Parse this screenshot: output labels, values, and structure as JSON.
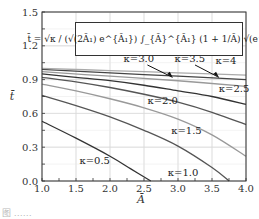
{
  "chart_data": {
    "type": "line",
    "title": "",
    "xlabel": "Ā",
    "ylabel": "t̄",
    "xlim": [
      1.0,
      4.0
    ],
    "ylim": [
      0.0,
      1.5
    ],
    "xticks": [
      "1.0",
      "1.5",
      "2.0",
      "2.5",
      "3.0",
      "3.5",
      "4.0"
    ],
    "yticks": [
      "0.0",
      "0.3",
      "0.6",
      "0.9",
      "1.2",
      "1.5"
    ],
    "grid": true,
    "formula": "t̄ = √κ / (√(2Ā₁) e^{Ā₁}) ∫_{Ā}^{Ā₁} (1 + 1/Ā) √(e^Ā) dĀ",
    "series": [
      {
        "name": "κ=0.5",
        "label": "κ=0.5",
        "x": [
          1.0,
          1.5,
          2.0,
          2.3,
          2.6
        ],
        "y": [
          0.53,
          0.38,
          0.22,
          0.11,
          0.0
        ]
      },
      {
        "name": "κ=1.0",
        "label": "κ=1.0",
        "x": [
          1.0,
          1.5,
          2.0,
          2.5,
          3.0,
          3.5,
          3.75
        ],
        "y": [
          0.76,
          0.67,
          0.57,
          0.45,
          0.31,
          0.12,
          0.0
        ]
      },
      {
        "name": "κ=1.5",
        "label": "κ=1.5",
        "x": [
          1.0,
          1.5,
          2.0,
          2.5,
          3.0,
          3.5,
          4.0
        ],
        "y": [
          0.86,
          0.8,
          0.73,
          0.65,
          0.55,
          0.41,
          0.22
        ]
      },
      {
        "name": "κ=2.0",
        "label": "κ=2.0",
        "x": [
          1.0,
          1.5,
          2.0,
          2.5,
          3.0,
          3.5,
          4.0
        ],
        "y": [
          0.92,
          0.88,
          0.83,
          0.77,
          0.7,
          0.61,
          0.5
        ]
      },
      {
        "name": "κ=2.5",
        "label": "κ=2.5",
        "x": [
          1.0,
          1.5,
          2.0,
          2.5,
          3.0,
          3.5,
          4.0
        ],
        "y": [
          0.95,
          0.92,
          0.89,
          0.85,
          0.8,
          0.75,
          0.68
        ]
      },
      {
        "name": "κ=3.0",
        "label": "κ=3.0",
        "x": [
          1.0,
          2.0,
          3.0,
          4.0
        ],
        "y": [
          0.97,
          0.93,
          0.89,
          0.84
        ]
      },
      {
        "name": "κ=3.5",
        "label": "κ=3.5",
        "x": [
          1.0,
          2.0,
          3.0,
          4.0
        ],
        "y": [
          0.99,
          0.96,
          0.93,
          0.9
        ]
      },
      {
        "name": "κ=4",
        "label": "κ=4",
        "x": [
          1.0,
          2.0,
          3.0,
          4.0
        ],
        "y": [
          1.0,
          0.98,
          0.96,
          0.94
        ]
      }
    ],
    "colors": {
      "dark": "#333333",
      "gray": "#888888",
      "grid": "#cccccc"
    }
  },
  "caption": "图 ……"
}
